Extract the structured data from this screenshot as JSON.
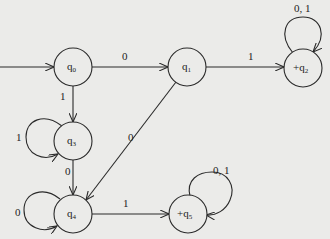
{
  "diagram": {
    "type": "finite automaton",
    "states": [
      {
        "id": "q0",
        "name": "q",
        "sub": "0",
        "prefix": "",
        "start": true,
        "accept": false
      },
      {
        "id": "q1",
        "name": "q",
        "sub": "1",
        "prefix": "",
        "start": false,
        "accept": false
      },
      {
        "id": "q2",
        "name": "q",
        "sub": "2",
        "prefix": "+",
        "start": false,
        "accept": true
      },
      {
        "id": "q3",
        "name": "q",
        "sub": "3",
        "prefix": "",
        "start": false,
        "accept": false
      },
      {
        "id": "q4",
        "name": "q",
        "sub": "4",
        "prefix": "",
        "start": false,
        "accept": false
      },
      {
        "id": "q5",
        "name": "q",
        "sub": "5",
        "prefix": "+",
        "start": false,
        "accept": true
      }
    ],
    "transitions": [
      {
        "from": "q0",
        "to": "q1",
        "label": "0"
      },
      {
        "from": "q0",
        "to": "q3",
        "label": "1"
      },
      {
        "from": "q1",
        "to": "q2",
        "label": "1"
      },
      {
        "from": "q1",
        "to": "q4",
        "label": "0"
      },
      {
        "from": "q2",
        "to": "q2",
        "label": "0, 1"
      },
      {
        "from": "q3",
        "to": "q3",
        "label": "1"
      },
      {
        "from": "q3",
        "to": "q4",
        "label": "0"
      },
      {
        "from": "q4",
        "to": "q4",
        "label": "0"
      },
      {
        "from": "q4",
        "to": "q5",
        "label": "1"
      },
      {
        "from": "q5",
        "to": "q5",
        "label": "0, 1"
      }
    ]
  }
}
